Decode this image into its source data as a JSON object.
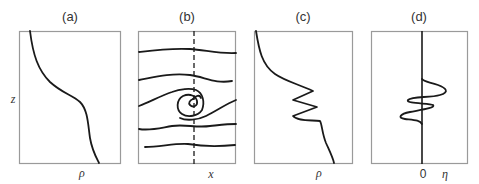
{
  "figure": {
    "panels": [
      {
        "id": "a",
        "label": "(a)",
        "xlabel": "ρ",
        "ylabel": "z",
        "description": "smooth density profile vs height"
      },
      {
        "id": "b",
        "label": "(b)",
        "xlabel": "x",
        "description": "streamlines with Kelvin-Helmholtz billow (spiral) around dashed vertical line"
      },
      {
        "id": "c",
        "label": "(c)",
        "xlabel": "ρ",
        "description": "density profile with overturning (zig-zag) region"
      },
      {
        "id": "d",
        "label": "(d)",
        "xlabel_zero": "0",
        "xlabel": "η",
        "description": "displacement profile oscillating about zero"
      }
    ],
    "colors": {
      "line": "#1a1a1a",
      "frame": "#9a9a9a",
      "text": "#333333"
    }
  }
}
